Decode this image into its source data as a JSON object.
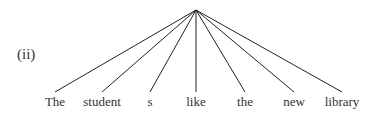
{
  "diagram": {
    "label": "(ii)",
    "apex": {
      "x": 196,
      "y": 10
    },
    "words": [
      {
        "text": "The",
        "x": 55,
        "line_end_y": 92
      },
      {
        "text": "student",
        "x": 102,
        "line_end_y": 92
      },
      {
        "text": "s",
        "x": 150,
        "line_end_y": 92
      },
      {
        "text": "like",
        "x": 196,
        "line_end_y": 92
      },
      {
        "text": "the",
        "x": 245,
        "line_end_y": 92
      },
      {
        "text": "new",
        "x": 294,
        "line_end_y": 92
      },
      {
        "text": "library",
        "x": 342,
        "line_end_y": 92
      }
    ],
    "line_color": "#222222"
  }
}
